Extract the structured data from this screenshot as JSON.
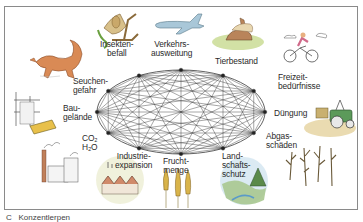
{
  "diagram": {
    "type": "network-of-interdependencies",
    "center": {
      "x": 181,
      "y": 112,
      "rx": 84,
      "ry": 42
    },
    "node_count": 12,
    "labels": [
      {
        "id": "insekten",
        "text": "Insekten-\nbefall"
      },
      {
        "id": "verkehr",
        "text": "Verkehrs-\nausweitung"
      },
      {
        "id": "tierbestand",
        "text": "Tierbestand"
      },
      {
        "id": "freizeit",
        "text": "Freizeit-\nbedürfnisse"
      },
      {
        "id": "duengung",
        "text": "Düngung"
      },
      {
        "id": "abgas",
        "text": "Abgas-\nschäden"
      },
      {
        "id": "landschaft",
        "text": "Land-\nschafts-\nschutz"
      },
      {
        "id": "frucht",
        "text": "Frucht-\nmenge"
      },
      {
        "id": "industrie",
        "text": "Industrie-\nexpansion"
      },
      {
        "id": "co2",
        "text": "CO₂\nH₂O"
      },
      {
        "id": "baugelaende",
        "text": "Bau-\ngelände"
      },
      {
        "id": "seuchen",
        "text": "Seuchen-\ngefahr"
      }
    ],
    "illustrations": [
      "fox-icon",
      "insect-branch-icon",
      "airplane-icon",
      "rabbit-icon",
      "cyclist-icon",
      "tractor-icon",
      "dead-trees-icon",
      "landscape-icon",
      "wheat-icon",
      "factory-icon",
      "construction-site-icon",
      "excavator-icon"
    ],
    "colors": {
      "frame": "#8a8a8a",
      "network": "#3a3a3a",
      "fox": "#d98a55",
      "airplane": "#a9c7d8",
      "rabbit": "#b9845a",
      "grass": "#c7d98e",
      "tractor": "#5c9a5a",
      "wheat": "#d9b44a",
      "sky": "#d7e8f2"
    }
  },
  "caption": "C   Konzentlerpen"
}
